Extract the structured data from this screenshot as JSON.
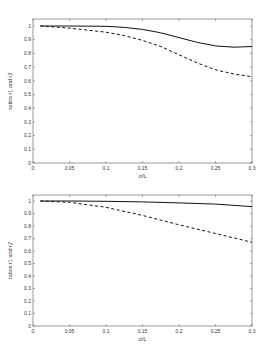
{
  "chart_data": [
    {
      "type": "line",
      "title": "",
      "xlabel": "σ/L",
      "ylabel": "ratios r1 and r2",
      "xlim": [
        0,
        0.3
      ],
      "ylim": [
        0,
        1.05
      ],
      "xticks": [
        "0",
        "0.05",
        "0.1",
        "0.15",
        "0.2",
        "0.25",
        "0.3"
      ],
      "yticks": [
        "0",
        "0.1",
        "0.2",
        "0.3",
        "0.4",
        "0.5",
        "0.6",
        "0.7",
        "0.8",
        "0.9",
        "1"
      ],
      "grid": false,
      "legend": null,
      "x": [
        0.01,
        0.05,
        0.1,
        0.125,
        0.15,
        0.175,
        0.2,
        0.225,
        0.25,
        0.275,
        0.3
      ],
      "series": [
        {
          "name": "r1",
          "style": "solid",
          "values": [
            1.0,
            1.0,
            0.998,
            0.99,
            0.975,
            0.95,
            0.915,
            0.88,
            0.855,
            0.845,
            0.85
          ]
        },
        {
          "name": "r2",
          "style": "dashed",
          "values": [
            1.0,
            0.985,
            0.955,
            0.93,
            0.895,
            0.85,
            0.79,
            0.73,
            0.68,
            0.65,
            0.63
          ]
        }
      ]
    },
    {
      "type": "line",
      "title": "",
      "xlabel": "σ/L",
      "ylabel": "ratios r1 and r2",
      "xlim": [
        0,
        0.3
      ],
      "ylim": [
        0,
        1.05
      ],
      "xticks": [
        "0",
        "0.05",
        "0.1",
        "0.15",
        "0.2",
        "0.25",
        "0.3"
      ],
      "yticks": [
        "0",
        "0.1",
        "0.2",
        "0.3",
        "0.4",
        "0.5",
        "0.6",
        "0.7",
        "0.8",
        "0.9",
        "1"
      ],
      "grid": false,
      "legend": null,
      "x": [
        0.01,
        0.05,
        0.1,
        0.15,
        0.2,
        0.25,
        0.3
      ],
      "series": [
        {
          "name": "r1",
          "style": "solid",
          "values": [
            1.0,
            1.0,
            0.998,
            0.993,
            0.985,
            0.975,
            0.955
          ]
        },
        {
          "name": "r2",
          "style": "dashed",
          "values": [
            1.0,
            0.99,
            0.95,
            0.885,
            0.81,
            0.74,
            0.67
          ]
        }
      ]
    }
  ]
}
